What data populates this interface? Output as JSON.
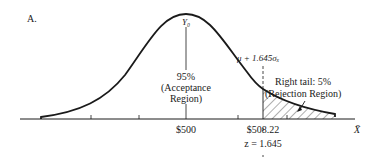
{
  "figure": {
    "panel_label": "A.",
    "peak_label": "Y₀",
    "acceptance": {
      "percent": "95%",
      "line1": "(Acceptance",
      "line2": "Region)"
    },
    "critical_label": "μ + 1.645σₓ",
    "rejection": {
      "line1": "Right tail: 5%",
      "line2": "(Rejection Region)"
    },
    "axis": {
      "mean_tick_label": "$500",
      "critical_tick_label": "$508.22",
      "z_label": "z = 1.645",
      "axis_label": "X̄"
    },
    "colors": {
      "ink": "#1a1a1a",
      "background": "#ffffff"
    }
  }
}
